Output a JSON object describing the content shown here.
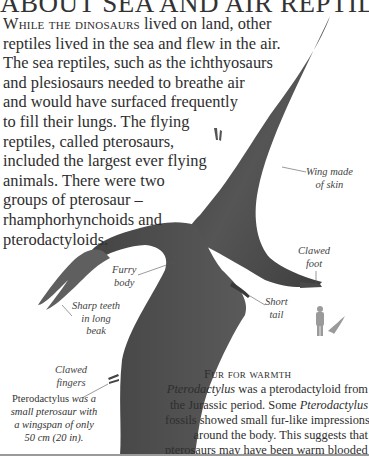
{
  "page": {
    "title": "ABOUT SEA AND AIR REPTILES",
    "intro": {
      "lead_smallcaps": "While the dinosaurs",
      "lines": [
        " lived on land, other",
        "reptiles lived in the sea and flew in the air.",
        "The sea reptiles, such as the ichthyosaurs",
        "and plesiosaurs needed to breathe air",
        "and would have surfaced frequently",
        "to fill their lungs. The flying",
        "reptiles, called pterosaurs,",
        "included the largest ever flying",
        "animals. There were two",
        "groups of pterosaur –",
        "rhamphorhynchoids and",
        "pterodactyloids."
      ]
    },
    "figure": {
      "subject": "Pterodactylus",
      "colors": {
        "body": "#4a4a4a",
        "body_dark": "#2f2f2f",
        "body_light": "#6e6e6e",
        "silhouette": "#9a9a9a",
        "leader": "#555555"
      },
      "labels": {
        "wing": [
          "Wing made",
          "of skin"
        ],
        "claw_foot": [
          "Clawed",
          "foot"
        ],
        "furry_body": [
          "Furry",
          "body"
        ],
        "short_tail": [
          "Short",
          "tail"
        ],
        "teeth": [
          "Sharp teeth",
          "in long",
          "beak"
        ],
        "claw_fingers": [
          "Clawed",
          "fingers"
        ]
      },
      "scale_icons": [
        "human-silhouette",
        "pterosaur-silhouette"
      ]
    },
    "caption_left": {
      "lines": [
        {
          "plain": "Pterodactylus",
          "italic": " was a"
        },
        {
          "italic": "small pterosaur with"
        },
        {
          "italic": "a wingspan of only"
        },
        {
          "italic": "50 cm (20 in)."
        }
      ]
    },
    "sidebar_box": {
      "heading": "Fur for warmth",
      "lines": [
        [
          {
            "t": "Pterodactylus",
            "i": true
          },
          {
            "t": " was a pterodactyloid from",
            "i": false
          }
        ],
        [
          {
            "t": "the Jurassic period. Some ",
            "i": false
          },
          {
            "t": "Pterodactylus",
            "i": true
          }
        ],
        [
          {
            "t": "fossils showed small fur-like impressions",
            "i": false
          }
        ],
        [
          {
            "t": "around the body. This suggests that",
            "i": false
          }
        ],
        [
          {
            "t": "pterosaurs may have been warm blooded and",
            "i": false
          }
        ],
        [
          {
            "t": "would have used fur to keep themselves warm.",
            "i": false
          }
        ]
      ]
    }
  }
}
